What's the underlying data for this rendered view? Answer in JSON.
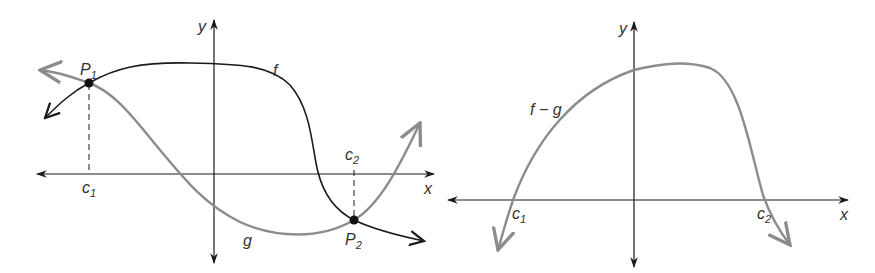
{
  "figure": {
    "left_panel": {
      "axes": {
        "x_label": "x",
        "y_label": "y"
      },
      "curves": [
        {
          "name": "f",
          "label": "f",
          "color": "#1a1a1a"
        },
        {
          "name": "g",
          "label": "g",
          "color": "#8c8c8c"
        }
      ],
      "points": [
        {
          "name": "P1",
          "label": "P",
          "subscript": "1"
        },
        {
          "name": "P2",
          "label": "P",
          "subscript": "2"
        }
      ],
      "x_marks": [
        {
          "label": "c",
          "subscript": "1"
        },
        {
          "label": "c",
          "subscript": "2"
        }
      ]
    },
    "right_panel": {
      "axes": {
        "x_label": "x",
        "y_label": "y"
      },
      "curve": {
        "name": "f-g",
        "label": "f − g",
        "color": "#8c8c8c"
      },
      "x_marks": [
        {
          "label": "c",
          "subscript": "1"
        },
        {
          "label": "c",
          "subscript": "2"
        }
      ]
    }
  }
}
